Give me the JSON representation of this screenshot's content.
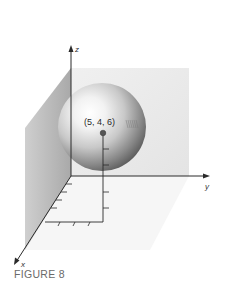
{
  "figure": {
    "caption": "FIGURE 8",
    "type": "3d-coordinate-diagram"
  },
  "axes": {
    "x_label": "x",
    "y_label": "y",
    "z_label": "z"
  },
  "point": {
    "label": "(5, 4, 6)",
    "coordinates": [
      5,
      4,
      6
    ]
  },
  "sphere": {
    "center_label": "(5, 4, 6)"
  },
  "ticks": {
    "x_ticks_on_floor": 3,
    "y_ticks_along_x_side": 4,
    "z_ticks_on_projection": 2,
    "y_line_ticks": 2
  },
  "colors": {
    "left_wall": "#b9b9b9",
    "back_wall": "#ececec",
    "floor": "#f6f6f6",
    "axis": "#2a2a2a",
    "sphere_highlight": "#ffffff",
    "sphere_shadow": "#4a4a4a",
    "caption": "#6a6a6a"
  }
}
